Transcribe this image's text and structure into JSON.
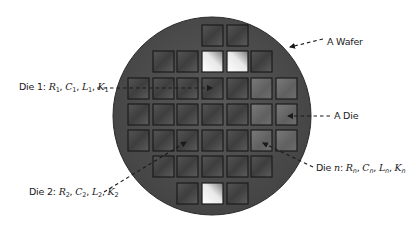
{
  "diagram": {
    "wafer": {
      "cx": 212,
      "cy": 116,
      "r": 99,
      "fill": "#4d4d4d",
      "edge": "#2a2a2a"
    },
    "die_grid": {
      "columns_x": [
        128,
        153,
        177,
        202,
        227,
        251,
        276
      ],
      "rows_y": [
        25,
        51,
        78,
        104,
        130,
        156,
        183
      ],
      "die_size": 21,
      "rows": [
        {
          "cols": [
            3,
            4
          ],
          "bright": []
        },
        {
          "cols": [
            1,
            2,
            3,
            4,
            5
          ],
          "bright": [
            3,
            4
          ]
        },
        {
          "cols": [
            0,
            1,
            2,
            3,
            4,
            5,
            6
          ],
          "bright": []
        },
        {
          "cols": [
            0,
            1,
            2,
            3,
            4,
            5,
            6
          ],
          "bright": []
        },
        {
          "cols": [
            0,
            1,
            2,
            3,
            4,
            5,
            6
          ],
          "bright": []
        },
        {
          "cols": [
            1,
            2,
            3,
            4,
            5
          ],
          "bright": []
        },
        {
          "cols": [
            2,
            3,
            4
          ],
          "bright": [
            3
          ]
        }
      ],
      "colors": {
        "die_dark": "#3f3f3f",
        "die_light": "#6a6a6a",
        "die_bright": "#f4f4f4",
        "border": "#1c1c1c"
      }
    },
    "annotations": [
      {
        "id": "wafer",
        "text": "A Wafer",
        "x": 327,
        "y": 43,
        "arrow": {
          "x1": 323,
          "y1": 39,
          "x2": 290,
          "y2": 47
        }
      },
      {
        "id": "die1",
        "prefix": "Die 1: ",
        "vars": [
          [
            "R",
            "1"
          ],
          [
            "C",
            "1"
          ],
          [
            "L",
            "1"
          ],
          [
            "K",
            "1"
          ]
        ],
        "x": 19,
        "y": 92,
        "arrow": {
          "x1": 97,
          "y1": 88,
          "x2": 212,
          "y2": 88
        }
      },
      {
        "id": "die",
        "text": "A Die",
        "x": 334,
        "y": 120,
        "arrow": {
          "x1": 330,
          "y1": 116,
          "x2": 288,
          "y2": 116
        }
      },
      {
        "id": "dien",
        "prefix": "Die ",
        "prefix_var": "n",
        "vars": [
          [
            "R",
            "n"
          ],
          [
            "C",
            "n"
          ],
          [
            "L",
            "n"
          ],
          [
            "K",
            "n"
          ]
        ],
        "x": 316,
        "y": 172,
        "arrow": {
          "x1": 313,
          "y1": 167,
          "x2": 263,
          "y2": 143
        }
      },
      {
        "id": "die2",
        "prefix": "Die 2: ",
        "vars": [
          [
            "R",
            "2"
          ],
          [
            "C",
            "2"
          ],
          [
            "L",
            "2"
          ],
          [
            "K",
            "2"
          ]
        ],
        "x": 29,
        "y": 196,
        "arrow": {
          "x1": 104,
          "y1": 192,
          "x2": 186,
          "y2": 142
        }
      }
    ],
    "labels": {
      "wafer": "A Wafer",
      "die": "A Die",
      "die1_prefix": "Die 1: ",
      "die2_prefix": "Die 2: ",
      "dien_prefix": "Die ",
      "dien_var": "n",
      "sep": ", ",
      "r": "R",
      "c": "C",
      "l": "L",
      "k": "K",
      "sub1": "1",
      "sub2": "2",
      "subn": "n"
    }
  }
}
